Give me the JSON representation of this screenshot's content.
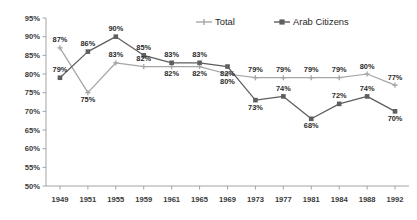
{
  "chart_data": {
    "type": "line",
    "title": "",
    "subtitle": "",
    "xlabel": "",
    "ylabel": "",
    "categories": [
      "1949",
      "1951",
      "1955",
      "1959",
      "1961",
      "1965",
      "1969",
      "1973",
      "1977",
      "1981",
      "1984",
      "1988",
      "1992"
    ],
    "ylim": [
      50,
      95
    ],
    "ytick_labels": [
      "50%",
      "55%",
      "60%",
      "65%",
      "70%",
      "75%",
      "80%",
      "85%",
      "90%",
      "95%"
    ],
    "ytick_values": [
      50,
      55,
      60,
      65,
      70,
      75,
      80,
      85,
      90,
      95
    ],
    "grid": false,
    "legend_position": "top-center",
    "series": [
      {
        "name": "Total",
        "color": "#a6a6a6",
        "marker": "cross",
        "values": [
          87,
          75,
          83,
          82,
          82,
          82,
          80,
          79,
          79,
          79,
          79,
          80,
          77
        ],
        "labels": [
          "87%",
          "75%",
          "83%",
          "82%",
          "82%",
          "82%",
          "80%",
          "79%",
          "79%",
          "79%",
          "79%",
          "80%",
          "77%"
        ]
      },
      {
        "name": "Arab Citizens",
        "color": "#5e5e5e",
        "marker": "square",
        "values": [
          79,
          86,
          90,
          85,
          83,
          83,
          82,
          73,
          74,
          68,
          72,
          74,
          70
        ],
        "labels": [
          "79%",
          "86%",
          "90%",
          "85%",
          "83%",
          "83%",
          "82%",
          "73%",
          "74%",
          "68%",
          "72%",
          "74%",
          "70%"
        ]
      }
    ]
  },
  "legend": {
    "items": [
      {
        "label": "Total"
      },
      {
        "label": "Arab Citizens"
      }
    ]
  }
}
